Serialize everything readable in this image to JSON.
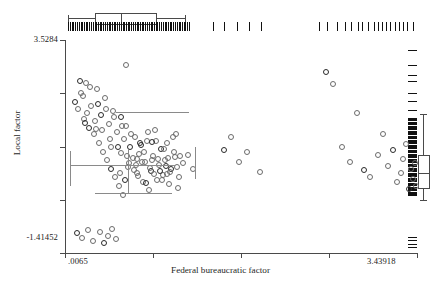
{
  "chart_data": {
    "type": "scatter",
    "title": "",
    "xlabel": "Federal bureaucratic factor",
    "ylabel": "Local factor",
    "xlim": [
      0.0065,
      3.43918
    ],
    "ylim": [
      -1.41452,
      3.5284
    ],
    "xticklabels": [
      ".0065",
      "3.43918"
    ],
    "yticklabels": [
      "3.5284",
      "-1.41452"
    ],
    "xtick_count": 5,
    "ytick_count": 5,
    "grid": false,
    "legend": false,
    "marker": "open-circle",
    "marginal_plots": {
      "top": {
        "type": "box-and-rug",
        "variable": "Federal bureaucratic factor"
      },
      "right": {
        "type": "box-and-rug",
        "variable": "Local factor"
      }
    },
    "x": [
      0.1,
      0.13,
      0.16,
      0.19,
      0.21,
      0.24,
      0.26,
      0.28,
      0.31,
      0.33,
      0.35,
      0.37,
      0.39,
      0.41,
      0.43,
      0.45,
      0.47,
      0.49,
      0.51,
      0.53,
      0.55,
      0.57,
      0.58,
      0.6,
      0.62,
      0.64,
      0.66,
      0.68,
      0.7,
      0.72,
      0.74,
      0.76,
      0.78,
      0.8,
      0.82,
      0.84,
      0.86,
      0.88,
      0.9,
      0.92,
      0.94,
      0.96,
      0.98,
      1.0,
      1.02,
      1.04,
      1.06,
      1.08,
      1.1,
      1.12,
      0.15,
      0.18,
      0.22,
      0.25,
      0.29,
      0.32,
      0.36,
      0.4,
      0.44,
      0.48,
      0.52,
      0.56,
      0.61,
      0.65,
      0.69,
      0.73,
      0.77,
      0.81,
      0.85,
      0.89,
      0.93,
      0.97,
      1.01,
      1.05,
      1.09,
      0.12,
      0.17,
      0.23,
      0.27,
      0.34,
      0.38,
      0.42,
      0.46,
      0.5,
      0.54,
      0.59,
      0.63,
      0.67,
      0.71,
      0.75,
      0.79,
      0.83,
      0.87,
      0.91,
      0.95,
      0.99,
      1.03,
      1.07,
      1.11,
      1.15,
      0.2,
      0.3,
      0.45,
      0.55,
      0.7,
      0.85,
      1.0,
      1.2,
      1.25,
      0.6,
      1.55,
      1.7,
      1.62,
      1.78,
      1.9,
      2.55,
      2.62,
      2.7,
      2.78,
      2.85,
      2.92,
      2.98,
      3.05,
      3.1,
      3.15,
      3.2,
      3.24,
      3.28,
      3.3,
      3.33,
      3.36,
      3.38,
      3.4,
      3.41,
      3.42
    ],
    "y": [
      2.1,
      1.95,
      2.3,
      1.7,
      2.55,
      1.5,
      2.0,
      1.35,
      2.4,
      1.15,
      1.8,
      0.95,
      2.2,
      0.75,
      1.6,
      0.55,
      1.9,
      0.35,
      1.4,
      0.15,
      1.75,
      -0.05,
      1.25,
      1.55,
      0.6,
      1.05,
      0.8,
      1.3,
      0.45,
      0.9,
      1.1,
      0.25,
      0.7,
      1.2,
      0.05,
      0.5,
      0.85,
      1.45,
      0.3,
      0.65,
      1.0,
      0.4,
      0.75,
      1.15,
      0.2,
      0.55,
      0.95,
      1.35,
      0.1,
      0.85,
      2.6,
      2.25,
      1.85,
      2.45,
      1.65,
      2.05,
      1.45,
      1.95,
      1.25,
      1.75,
      1.05,
      1.55,
      0.85,
      1.35,
      0.65,
      1.15,
      0.95,
      1.4,
      0.75,
      1.2,
      0.5,
      1.0,
      0.8,
      1.3,
      0.6,
      -0.95,
      -1.05,
      -0.88,
      -1.12,
      -0.92,
      -1.18,
      -1.0,
      -0.85,
      -1.08,
      0.45,
      0.3,
      0.68,
      0.52,
      0.38,
      0.72,
      0.22,
      0.58,
      0.42,
      0.78,
      0.28,
      0.62,
      0.48,
      0.82,
      0.35,
      0.68,
      1.62,
      1.48,
      1.05,
      0.92,
      0.78,
      1.18,
      0.42,
      0.88,
      0.55,
      2.95,
      0.98,
      0.72,
      1.28,
      0.95,
      0.48,
      2.8,
      2.52,
      1.05,
      0.72,
      1.85,
      0.52,
      0.35,
      0.88,
      1.35,
      0.62,
      0.98,
      0.25,
      0.45,
      0.78,
      1.12,
      0.08,
      0.55,
      0.32,
      0.68,
      0.15
    ],
    "n_points": 155,
    "top_boxplot": {
      "whisker_low": 0.04,
      "q1": 0.3,
      "median": 0.55,
      "q3": 0.88,
      "whisker_high": 1.18
    },
    "right_boxplot": {
      "whisker_low": -0.18,
      "q1": 0.12,
      "median": 0.44,
      "q3": 0.86,
      "whisker_high": 1.82
    }
  },
  "labels": {
    "x_title": "Federal bureaucratic factor",
    "y_title": "Local factor",
    "x_min": ".0065",
    "x_max": "3.43918",
    "y_min": "-1.41452",
    "y_max": "3.5284"
  }
}
